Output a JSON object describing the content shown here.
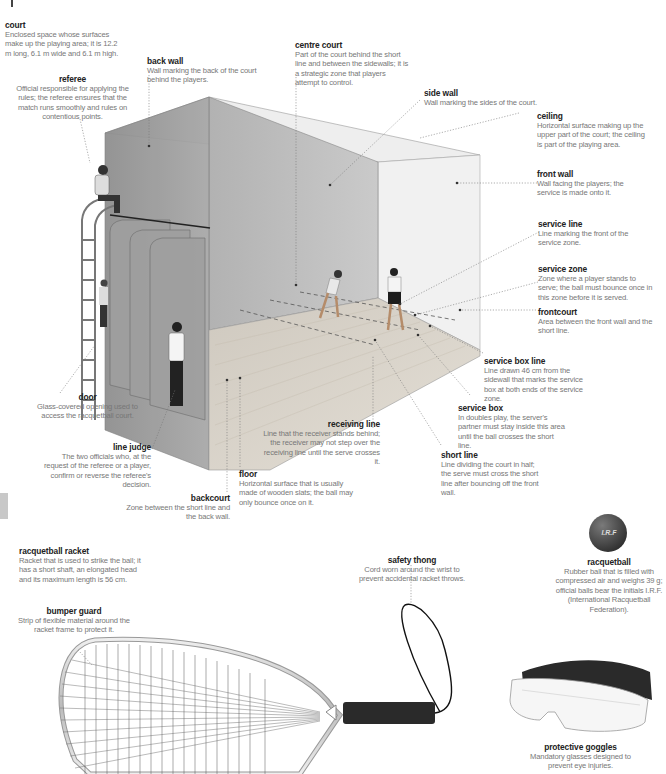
{
  "labels": {
    "court": {
      "title": "court",
      "desc": "Enclosed space whose surfaces make up the playing area; it is 12.2 m long, 6.1 m wide and 6.1 m high."
    },
    "referee": {
      "title": "referee",
      "desc": "Official responsible for applying the rules; the referee ensures that the match runs smoothly and rules on contentious points."
    },
    "back_wall": {
      "title": "back wall",
      "desc": "Wall marking the back of the court behind the players."
    },
    "centre_court": {
      "title": "centre court",
      "desc": "Part of the court behind the short line and between the sidewalls; it is a strategic zone that players attempt to control."
    },
    "side_wall": {
      "title": "side wall",
      "desc": "Wall marking the sides of the court."
    },
    "ceiling": {
      "title": "ceiling",
      "desc": "Horizontal surface making up the upper part of the court; the ceiling is part of the playing area."
    },
    "front_wall": {
      "title": "front wall",
      "desc": "Wall facing the players; the service is made onto it."
    },
    "service_line": {
      "title": "service line",
      "desc": "Line marking the front of the service zone."
    },
    "service_zone": {
      "title": "service zone",
      "desc": "Zone where a player stands to serve; the ball must bounce once in this zone before it is served."
    },
    "frontcourt": {
      "title": "frontcourt",
      "desc": "Area between the front wall and the short line."
    },
    "service_box_line": {
      "title": "service box line",
      "desc": "Line drawn 46 cm from the sidewall that marks the service box at both ends of the service zone."
    },
    "service_box": {
      "title": "service box",
      "desc": "In doubles play, the server's partner must stay inside this area until the ball crosses the short line."
    },
    "short_line": {
      "title": "short line",
      "desc": "Line dividing the court in half; the serve must cross the short line after bouncing off the front wall."
    },
    "receiving_line": {
      "title": "receiving line",
      "desc": "Line that the receiver stands behind; the receiver may not step over the receiving line until the serve crosses it."
    },
    "floor": {
      "title": "floor",
      "desc": "Horizontal surface that is usually made of wooden slats; the ball may only bounce once on it."
    },
    "backcourt": {
      "title": "backcourt",
      "desc": "Zone between the short line and the back wall."
    },
    "line_judge": {
      "title": "line judge",
      "desc": "The two officials who, at the request of the referee or a player, confirm or reverse the referee's decision."
    },
    "door": {
      "title": "door",
      "desc": "Glass-covered opening used to access the racquetball court."
    },
    "racquetball_racket": {
      "title": "racquetball racket",
      "desc": "Racket that is used to strike the ball; it has a short shaft, an elongated head and its maximum length is 56 cm."
    },
    "bumper_guard": {
      "title": "bumper guard",
      "desc": "Strip of flexible material around the racket frame to protect it."
    },
    "safety_thong": {
      "title": "safety thong",
      "desc": "Cord worn around the wrist to prevent accidental racket throws."
    },
    "racquetball": {
      "title": "racquetball",
      "desc": "Rubber ball that is filled with compressed air and weighs 39 g; official balls bear the initials I.R.F. (International Racquetball Federation)."
    },
    "protective_goggles": {
      "title": "protective goggles",
      "desc": "Mandatory glasses designed to prevent eye injuries."
    }
  },
  "ball": {
    "initials": "I.R.F"
  },
  "colors": {
    "title_text": "#222222",
    "desc_text": "#777777",
    "wall": "#9a9a9a",
    "floor": "#d8d2c8",
    "ball": "#4a4a4a"
  }
}
